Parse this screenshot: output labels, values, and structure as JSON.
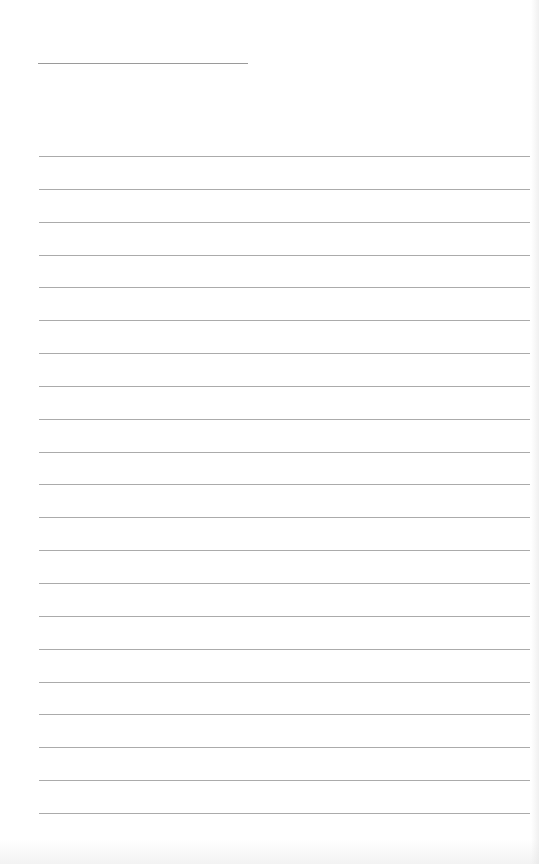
{
  "page": {
    "type": "lined-paper",
    "background_color": "#ffffff",
    "line_color": "#ababab",
    "title_line": {
      "label": "",
      "value": ""
    },
    "writing_lines": [
      {
        "text": ""
      },
      {
        "text": ""
      },
      {
        "text": ""
      },
      {
        "text": ""
      },
      {
        "text": ""
      },
      {
        "text": ""
      },
      {
        "text": ""
      },
      {
        "text": ""
      },
      {
        "text": ""
      },
      {
        "text": ""
      },
      {
        "text": ""
      },
      {
        "text": ""
      },
      {
        "text": ""
      },
      {
        "text": ""
      },
      {
        "text": ""
      },
      {
        "text": ""
      },
      {
        "text": ""
      },
      {
        "text": ""
      },
      {
        "text": ""
      },
      {
        "text": ""
      },
      {
        "text": ""
      }
    ]
  }
}
